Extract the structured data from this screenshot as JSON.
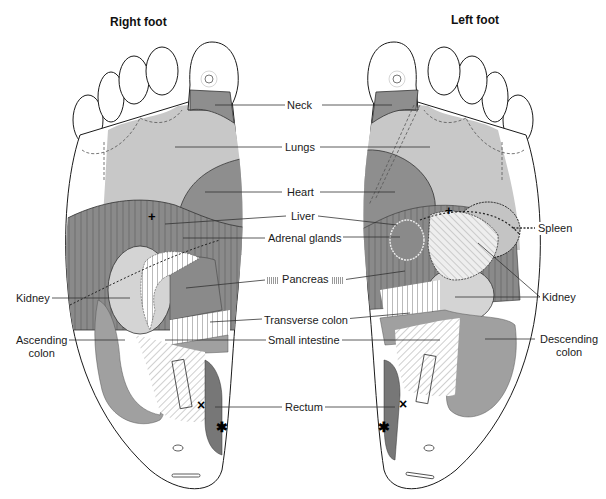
{
  "titles": {
    "right_foot": "Right foot",
    "left_foot": "Left foot"
  },
  "labels": {
    "neck": "Neck",
    "lungs": "Lungs",
    "heart": "Heart",
    "liver": "Liver",
    "adrenal_glands": "Adrenal glands",
    "pancreas": "Pancreas",
    "spleen": "Spleen",
    "kidney_left_side": "Kidney",
    "kidney_right_side": "Kidney",
    "transverse_colon": "Transverse colon",
    "small_intestine": "Small intestine",
    "ascending_colon_1": "Ascending",
    "ascending_colon_2": "colon",
    "descending_colon_1": "Descending",
    "descending_colon_2": "colon",
    "rectum": "Rectum"
  },
  "colors": {
    "outline": "#1a1a1a",
    "light_zone": "#c8c8c8",
    "mid_zone": "#a6a6a6",
    "dark_zone": "#8a8a8a",
    "darker_zone": "#7a7a7a",
    "leader_line": "#333333",
    "background": "#ffffff"
  },
  "markers": {
    "cross": "×",
    "asterisk": "✱",
    "plus": "+"
  }
}
